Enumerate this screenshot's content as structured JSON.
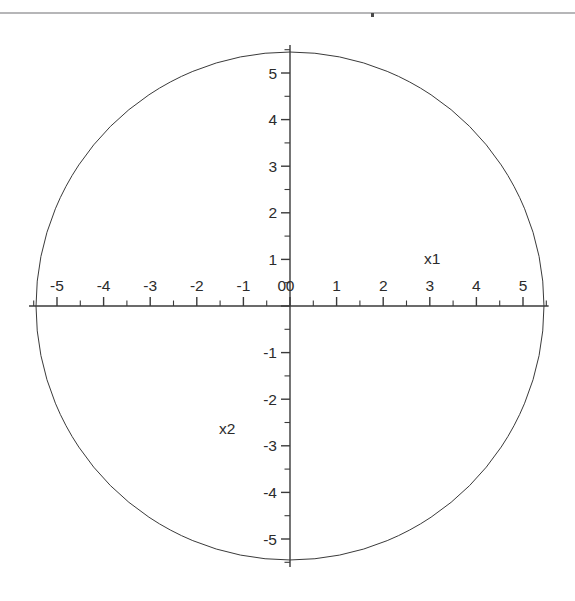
{
  "figure": {
    "type": "plot",
    "background_color": "#ffffff",
    "line_color": "#3a3a3a",
    "text_color": "#2b2b2b",
    "scan_artifact": {
      "present": true,
      "color": "#a9a9ac",
      "y": 13
    }
  },
  "axes": {
    "x_axis_label": "x1",
    "y_axis_label": "x2",
    "x_major_ticks": [
      -5,
      -4,
      -3,
      -2,
      -1,
      0,
      1,
      2,
      3,
      4,
      5
    ],
    "y_major_ticks": [
      -5,
      -4,
      -3,
      -2,
      -1,
      0,
      1,
      2,
      3,
      4,
      5
    ],
    "x_major_tick_labels": [
      "-5",
      "-4",
      "-3",
      "-2",
      "-1",
      "0",
      "1",
      "2",
      "3",
      "4",
      "5"
    ],
    "y_major_tick_labels": [
      "-5",
      "-4",
      "-3",
      "-2",
      "-1",
      "0",
      "1",
      "2",
      "3",
      "4",
      "5"
    ],
    "minor_tick_step": 0.5,
    "xlim": [
      -5.6,
      5.55
    ],
    "ylim": [
      -5.6,
      5.6
    ],
    "grid": false,
    "legend": false,
    "axis_style": "crossed-at-origin"
  },
  "chart_data": {
    "type": "line",
    "title": "",
    "subtitle": "",
    "xlabel": "x1",
    "ylabel": "x2",
    "xlim": [
      -5.6,
      5.55
    ],
    "ylim": [
      -5.6,
      5.6
    ],
    "grid": false,
    "legend_position": "none",
    "xticks": [
      -5,
      -4,
      -3,
      -2,
      -1,
      0,
      1,
      2,
      3,
      4,
      5
    ],
    "yticks": [
      -5,
      -4,
      -3,
      -2,
      -1,
      0,
      1,
      2,
      3,
      4,
      5
    ],
    "xticklabels": [
      "-5",
      "-4",
      "-3",
      "-2",
      "-1",
      "0",
      "1",
      "2",
      "3",
      "4",
      "5"
    ],
    "yticklabels": [
      "-5",
      "-4",
      "-3",
      "-2",
      "-1",
      "0",
      "1",
      "2",
      "3",
      "4",
      "5"
    ],
    "annotations": [
      {
        "text": "x1",
        "x": 3.05,
        "y": 0.9
      },
      {
        "text": "x2",
        "x": -1.35,
        "y": -2.75
      }
    ],
    "series": [
      {
        "name": "circle",
        "shape": "circle",
        "center": [
          0,
          0
        ],
        "radius": 5.45,
        "equation": "x1^2 + x2^2 = 5.45^2",
        "closed": true,
        "filled": false,
        "color": "#3a3a3a",
        "linewidth": 1
      }
    ]
  }
}
